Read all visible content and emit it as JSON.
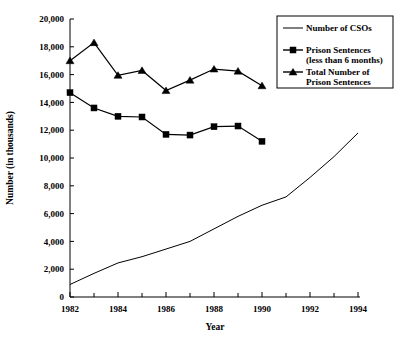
{
  "chart_data": {
    "type": "line",
    "title": "",
    "xlabel": "Year",
    "ylabel": "Number (in thousands)",
    "xlim": [
      1982,
      1994
    ],
    "ylim": [
      0,
      20000
    ],
    "grid": false,
    "legend_position": "top-right",
    "x": [
      1982,
      1983,
      1984,
      1985,
      1986,
      1987,
      1988,
      1989,
      1990,
      1991,
      1992,
      1993,
      1994
    ],
    "xtick_labels": [
      "1982",
      "1984",
      "1986",
      "1988",
      "1990",
      "1992",
      "1994"
    ],
    "xtick_values": [
      1982,
      1984,
      1986,
      1988,
      1990,
      1992,
      1994
    ],
    "xtick_minor_values": [
      1983,
      1985,
      1987,
      1989,
      1991,
      1993
    ],
    "ytick_labels": [
      "0",
      "2,000",
      "4,000",
      "6,000",
      "8,000",
      "10,000",
      "12,000",
      "14,000",
      "16,000",
      "18,000",
      "20,000"
    ],
    "ytick_values": [
      0,
      2000,
      4000,
      6000,
      8000,
      10000,
      12000,
      14000,
      16000,
      18000,
      20000
    ],
    "series": [
      {
        "name": "Number of CSOs",
        "marker": "none",
        "x": [
          1982,
          1983,
          1984,
          1985,
          1986,
          1987,
          1988,
          1989,
          1990,
          1991,
          1992,
          1993,
          1994
        ],
        "values": [
          900,
          1700,
          2450,
          2900,
          3450,
          4000,
          4900,
          5800,
          6600,
          7200,
          8600,
          10100,
          11800
        ]
      },
      {
        "name": "Prison Sentences (less than 6 months)",
        "marker": "square",
        "x": [
          1982,
          1983,
          1984,
          1985,
          1986,
          1987,
          1988,
          1989,
          1990
        ],
        "values": [
          14700,
          13600,
          13000,
          12950,
          11700,
          11650,
          12250,
          12300,
          11200
        ]
      },
      {
        "name": "Total Number of Prison Sentences",
        "marker": "triangle",
        "x": [
          1982,
          1983,
          1984,
          1985,
          1986,
          1987,
          1988,
          1989,
          1990
        ],
        "values": [
          17000,
          18300,
          15950,
          16300,
          14850,
          15600,
          16400,
          16250,
          15200
        ]
      }
    ]
  },
  "axes": {
    "ylabel": "Number (in thousands)",
    "xlabel": "Year"
  },
  "legend": {
    "items": [
      {
        "label_line1": "Number of CSOs",
        "label_line2": "",
        "marker": "none"
      },
      {
        "label_line1": "Prison Sentences",
        "label_line2": "(less than 6 months)",
        "marker": "square"
      },
      {
        "label_line1": "Total Number of",
        "label_line2": "Prison Sentences",
        "marker": "triangle"
      }
    ]
  },
  "ytick_labels": {
    "t0": "0",
    "t1": "2,000",
    "t2": "4,000",
    "t3": "6,000",
    "t4": "8,000",
    "t5": "10,000",
    "t6": "12,000",
    "t7": "14,000",
    "t8": "16,000",
    "t9": "18,000",
    "t10": "20,000"
  },
  "xtick_labels": {
    "t0": "1982",
    "t1": "1984",
    "t2": "1986",
    "t3": "1988",
    "t4": "1990",
    "t5": "1992",
    "t6": "1994"
  },
  "colors": {
    "ink": "#000000",
    "background": "#ffffff"
  }
}
